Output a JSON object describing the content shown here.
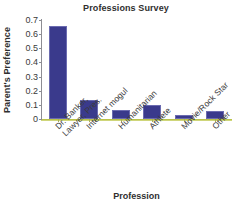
{
  "chart_data": {
    "type": "bar",
    "title": "Professions Survey",
    "xlabel": "Profession",
    "ylabel": "Parent's Preference",
    "categories": [
      "Dr. Banker, Lawyer, Pres.",
      "Internet mogul",
      "Humanitarian",
      "Athlete",
      "Movie/Rock Star",
      "Other"
    ],
    "category_lines": [
      [
        "Dr. Banker,",
        "Lawyer, Pres."
      ],
      [
        "Internet mogul"
      ],
      [
        "Humanitarian"
      ],
      [
        "Athlete"
      ],
      [
        "Movie/Rock Star"
      ],
      [
        "Other"
      ]
    ],
    "values": [
      0.66,
      0.135,
      0.065,
      0.1,
      0.03,
      0.06
    ],
    "ylim": [
      0,
      0.7
    ],
    "ytick_labels": [
      "0.7",
      "0.6",
      "0.5",
      "0.4",
      "0.3",
      "0.2",
      "0.1",
      "0"
    ],
    "ytick_values": [
      0.7,
      0.6,
      0.5,
      0.4,
      0.3,
      0.2,
      0.1,
      0
    ],
    "grid": false,
    "legend": false,
    "bar_color": "#3a3a8c",
    "bar_edge_color": "#6b6bb0",
    "axis_color": "#8d8d93",
    "baseline_color": "#b9c24a"
  }
}
